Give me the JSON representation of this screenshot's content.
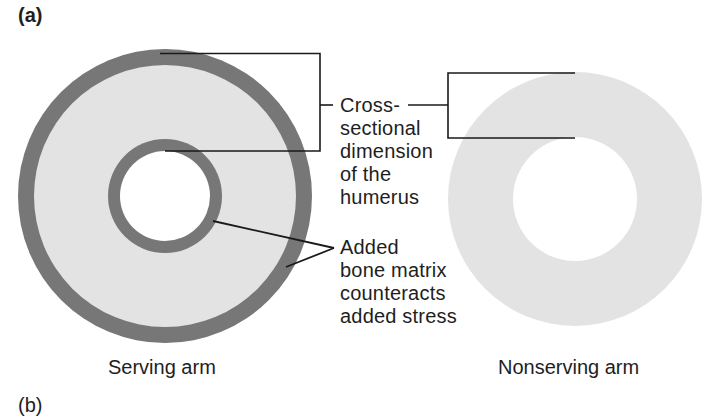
{
  "panels": {
    "top_label": "(a)",
    "bottom_label": "(b)"
  },
  "colors": {
    "cortical_bone_dark": "#777777",
    "bone_light": "#e3e3e3",
    "marrow_cavity": "#ffffff",
    "line": "#1a1a1a"
  },
  "annotations": {
    "dimension": {
      "lines": [
        "Cross-",
        "sectional",
        "dimension",
        "of the",
        "humerus"
      ]
    },
    "added_matrix": {
      "lines": [
        "Added",
        "bone matrix",
        "counteracts",
        "added stress"
      ]
    }
  },
  "captions": {
    "serving": "Serving arm",
    "nonserving": "Nonserving arm"
  }
}
